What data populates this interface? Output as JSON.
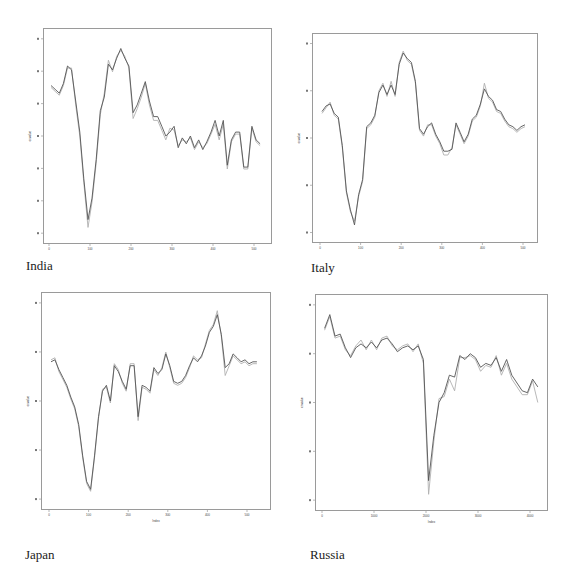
{
  "figure": {
    "panels": [
      {
        "id": "india",
        "caption": "India"
      },
      {
        "id": "italy",
        "caption": "Italy"
      },
      {
        "id": "japan",
        "caption": "Japan"
      },
      {
        "id": "russia",
        "caption": "Russia"
      }
    ]
  },
  "chart_data": [
    {
      "type": "line",
      "title": "India",
      "xlabel": "",
      "ylabel": "cnvalue",
      "x_ticks": [
        "0",
        "100",
        "200",
        "300",
        "400",
        "500"
      ],
      "y_ticks": [
        "",
        "",
        "",
        "",
        "",
        "",
        ""
      ],
      "xlim": [
        -10,
        530
      ],
      "ylim": [
        0,
        100
      ],
      "grid": false,
      "series": [
        {
          "name": "actual",
          "color": "#555555",
          "x": [
            5,
            15,
            25,
            35,
            45,
            55,
            65,
            75,
            85,
            95,
            105,
            115,
            125,
            135,
            145,
            155,
            165,
            175,
            185,
            195,
            205,
            215,
            225,
            235,
            245,
            255,
            265,
            275,
            285,
            295,
            305,
            315,
            325,
            335,
            345,
            355,
            365,
            375,
            385,
            395,
            405,
            415,
            425,
            435,
            445,
            455,
            465,
            475,
            485,
            495,
            505,
            515
          ],
          "y": [
            76,
            74,
            72,
            77,
            86,
            84,
            68,
            52,
            28,
            7,
            18,
            38,
            63,
            70,
            87,
            84,
            90,
            95,
            90,
            86,
            62,
            66,
            72,
            78,
            68,
            60,
            60,
            55,
            50,
            52,
            55,
            44,
            49,
            46,
            50,
            44,
            48,
            43,
            47,
            52,
            58,
            50,
            58,
            35,
            48,
            52,
            52,
            34,
            34,
            55,
            48,
            46
          ]
        },
        {
          "name": "predicted",
          "color": "#b0b0b0",
          "x": [
            5,
            15,
            25,
            35,
            45,
            55,
            65,
            75,
            85,
            95,
            105,
            115,
            125,
            135,
            145,
            155,
            165,
            175,
            185,
            195,
            205,
            215,
            225,
            235,
            245,
            255,
            265,
            275,
            285,
            295,
            305,
            315,
            325,
            335,
            345,
            355,
            365,
            375,
            385,
            395,
            405,
            415,
            425,
            435,
            445,
            455,
            465,
            475,
            485,
            495,
            505,
            515
          ],
          "y": [
            75,
            73,
            71,
            76,
            85,
            85,
            66,
            50,
            26,
            3,
            16,
            36,
            61,
            72,
            89,
            83,
            91,
            94,
            91,
            85,
            59,
            64,
            70,
            77,
            66,
            58,
            58,
            53,
            48,
            54,
            53,
            45,
            48,
            47,
            49,
            43,
            47,
            44,
            46,
            51,
            56,
            48,
            56,
            33,
            47,
            51,
            51,
            33,
            33,
            54,
            47,
            45
          ]
        }
      ]
    },
    {
      "type": "line",
      "title": "Italy",
      "xlabel": "",
      "ylabel": "cnvalue",
      "x_ticks": [
        "0",
        "100",
        "200",
        "300",
        "400",
        "500"
      ],
      "y_ticks": [
        "",
        "",
        "",
        "",
        ""
      ],
      "xlim": [
        -10,
        530
      ],
      "ylim": [
        0,
        100
      ],
      "grid": false,
      "series": [
        {
          "name": "actual",
          "color": "#555555",
          "x": [
            5,
            15,
            25,
            35,
            45,
            55,
            65,
            75,
            85,
            95,
            105,
            115,
            125,
            135,
            145,
            155,
            165,
            175,
            185,
            195,
            205,
            215,
            225,
            235,
            245,
            255,
            265,
            275,
            285,
            295,
            305,
            315,
            325,
            335,
            345,
            355,
            365,
            375,
            385,
            395,
            405,
            415,
            425,
            435,
            445,
            455,
            465,
            475,
            485,
            495,
            505
          ],
          "y": [
            64,
            67,
            68,
            63,
            61,
            46,
            22,
            12,
            4,
            20,
            28,
            56,
            58,
            62,
            74,
            78,
            73,
            78,
            73,
            89,
            95,
            92,
            90,
            80,
            55,
            52,
            56,
            58,
            52,
            48,
            43,
            43,
            44,
            58,
            53,
            48,
            52,
            60,
            62,
            68,
            76,
            72,
            70,
            65,
            64,
            60,
            57,
            56,
            54,
            56,
            57
          ]
        },
        {
          "name": "predicted",
          "color": "#b0b0b0",
          "x": [
            5,
            15,
            25,
            35,
            45,
            55,
            65,
            75,
            85,
            95,
            105,
            115,
            125,
            135,
            145,
            155,
            165,
            175,
            185,
            195,
            205,
            215,
            225,
            235,
            245,
            255,
            265,
            275,
            285,
            295,
            305,
            315,
            325,
            335,
            345,
            355,
            365,
            375,
            385,
            395,
            405,
            415,
            425,
            435,
            445,
            455,
            465,
            475,
            485,
            495,
            505
          ],
          "y": [
            63,
            66,
            69,
            62,
            60,
            45,
            21,
            11,
            6,
            19,
            27,
            55,
            57,
            61,
            75,
            79,
            72,
            80,
            72,
            90,
            96,
            91,
            89,
            79,
            54,
            51,
            57,
            57,
            51,
            47,
            41,
            41,
            45,
            57,
            52,
            47,
            51,
            59,
            61,
            67,
            79,
            71,
            69,
            64,
            63,
            59,
            56,
            55,
            53,
            55,
            56
          ]
        }
      ]
    },
    {
      "type": "line",
      "title": "Japan",
      "xlabel": "Index",
      "ylabel": "cnvalue",
      "x_ticks": [
        "0",
        "100",
        "200",
        "300",
        "400",
        "500"
      ],
      "y_ticks": [
        "",
        "",
        "",
        "",
        ""
      ],
      "xlim": [
        -10,
        550
      ],
      "ylim": [
        0,
        100
      ],
      "grid": false,
      "series": [
        {
          "name": "actual",
          "color": "#555555",
          "x": [
            5,
            15,
            25,
            35,
            45,
            55,
            65,
            75,
            85,
            95,
            105,
            115,
            125,
            135,
            145,
            155,
            165,
            175,
            185,
            195,
            205,
            215,
            225,
            235,
            245,
            255,
            265,
            275,
            285,
            295,
            305,
            315,
            325,
            335,
            345,
            355,
            365,
            375,
            385,
            395,
            405,
            415,
            425,
            435,
            445,
            455,
            465,
            475,
            485,
            495,
            505,
            515,
            525
          ],
          "y": [
            70,
            71,
            66,
            62,
            58,
            52,
            47,
            38,
            22,
            9,
            5,
            22,
            42,
            55,
            58,
            50,
            68,
            65,
            60,
            56,
            68,
            68,
            42,
            58,
            57,
            55,
            67,
            64,
            66,
            74,
            68,
            60,
            59,
            60,
            63,
            68,
            72,
            70,
            73,
            78,
            85,
            88,
            94,
            84,
            67,
            69,
            74,
            72,
            70,
            71,
            69,
            70,
            70
          ]
        },
        {
          "name": "predicted",
          "color": "#b0b0b0",
          "x": [
            5,
            15,
            25,
            35,
            45,
            55,
            65,
            75,
            85,
            95,
            105,
            115,
            125,
            135,
            145,
            155,
            165,
            175,
            185,
            195,
            205,
            215,
            225,
            235,
            245,
            255,
            265,
            275,
            285,
            295,
            305,
            315,
            325,
            335,
            345,
            355,
            365,
            375,
            385,
            395,
            405,
            415,
            425,
            435,
            445,
            455,
            465,
            475,
            485,
            495,
            505,
            515,
            525
          ],
          "y": [
            71,
            72,
            65,
            61,
            57,
            51,
            46,
            37,
            21,
            8,
            4,
            21,
            41,
            56,
            57,
            49,
            69,
            66,
            59,
            55,
            69,
            69,
            40,
            57,
            56,
            54,
            66,
            63,
            67,
            75,
            67,
            59,
            58,
            59,
            62,
            67,
            73,
            71,
            72,
            79,
            86,
            89,
            96,
            83,
            63,
            68,
            73,
            71,
            69,
            70,
            68,
            69,
            69
          ]
        }
      ]
    },
    {
      "type": "line",
      "title": "Russia",
      "xlabel": "Index",
      "ylabel": "cnvalue",
      "x_ticks": [
        "0",
        "1000",
        "2000",
        "3000",
        "4000"
      ],
      "y_ticks": [
        "",
        "",
        "",
        "",
        ""
      ],
      "xlim": [
        -100,
        4300
      ],
      "ylim": [
        0,
        100
      ],
      "grid": false,
      "series": [
        {
          "name": "actual",
          "color": "#555555",
          "x": [
            50,
            150,
            250,
            350,
            450,
            550,
            650,
            750,
            850,
            950,
            1050,
            1150,
            1250,
            1350,
            1450,
            1550,
            1650,
            1750,
            1850,
            1950,
            2050,
            2150,
            2250,
            2350,
            2450,
            2550,
            2650,
            2750,
            2850,
            2950,
            3050,
            3150,
            3250,
            3350,
            3450,
            3550,
            3650,
            3750,
            3850,
            3950,
            4050,
            4150
          ],
          "y": [
            88,
            95,
            84,
            85,
            78,
            73,
            78,
            80,
            78,
            81,
            78,
            82,
            83,
            80,
            76,
            78,
            79,
            77,
            79,
            72,
            10,
            33,
            50,
            55,
            64,
            63,
            74,
            72,
            75,
            73,
            68,
            70,
            69,
            73,
            66,
            72,
            64,
            60,
            56,
            55,
            62,
            58
          ]
        },
        {
          "name": "predicted",
          "color": "#b0b0b0",
          "x": [
            50,
            150,
            250,
            350,
            450,
            550,
            650,
            750,
            850,
            950,
            1050,
            1150,
            1250,
            1350,
            1450,
            1550,
            1650,
            1750,
            1850,
            1950,
            2050,
            2150,
            2250,
            2350,
            2450,
            2550,
            2650,
            2750,
            2850,
            2950,
            3050,
            3150,
            3250,
            3350,
            3450,
            3550,
            3650,
            3750,
            3850,
            3950,
            4050,
            4150
          ],
          "y": [
            87,
            94,
            83,
            84,
            77,
            74,
            79,
            82,
            77,
            82,
            77,
            83,
            84,
            79,
            77,
            79,
            80,
            76,
            80,
            70,
            3,
            30,
            52,
            53,
            62,
            56,
            73,
            73,
            74,
            72,
            66,
            69,
            68,
            74,
            64,
            70,
            62,
            58,
            54,
            54,
            61,
            50
          ]
        }
      ]
    }
  ]
}
